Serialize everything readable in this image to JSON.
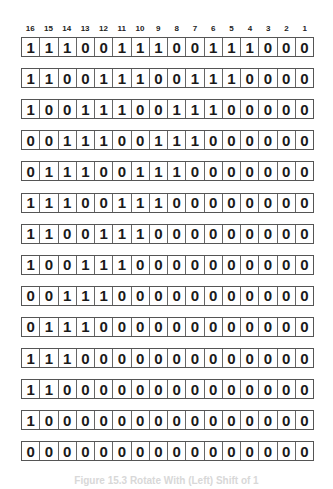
{
  "diagram": {
    "bit_positions": [
      "16",
      "15",
      "14",
      "13",
      "12",
      "11",
      "10",
      "9",
      "8",
      "7",
      "6",
      "5",
      "4",
      "3",
      "2",
      "1"
    ],
    "rows": [
      "1110011100111000",
      "1100111001110000",
      "1001110011100000",
      "0011100111000000",
      "0111001110000000",
      "1110011100000000",
      "1100111000000000",
      "1001110000000000",
      "0011100000000000",
      "0111000000000000",
      "1110000000000000",
      "1100000000000000",
      "1000000000000000",
      "0000000000000000"
    ],
    "caption": "Figure 15.3 Rotate With (Left) Shift of 1"
  }
}
